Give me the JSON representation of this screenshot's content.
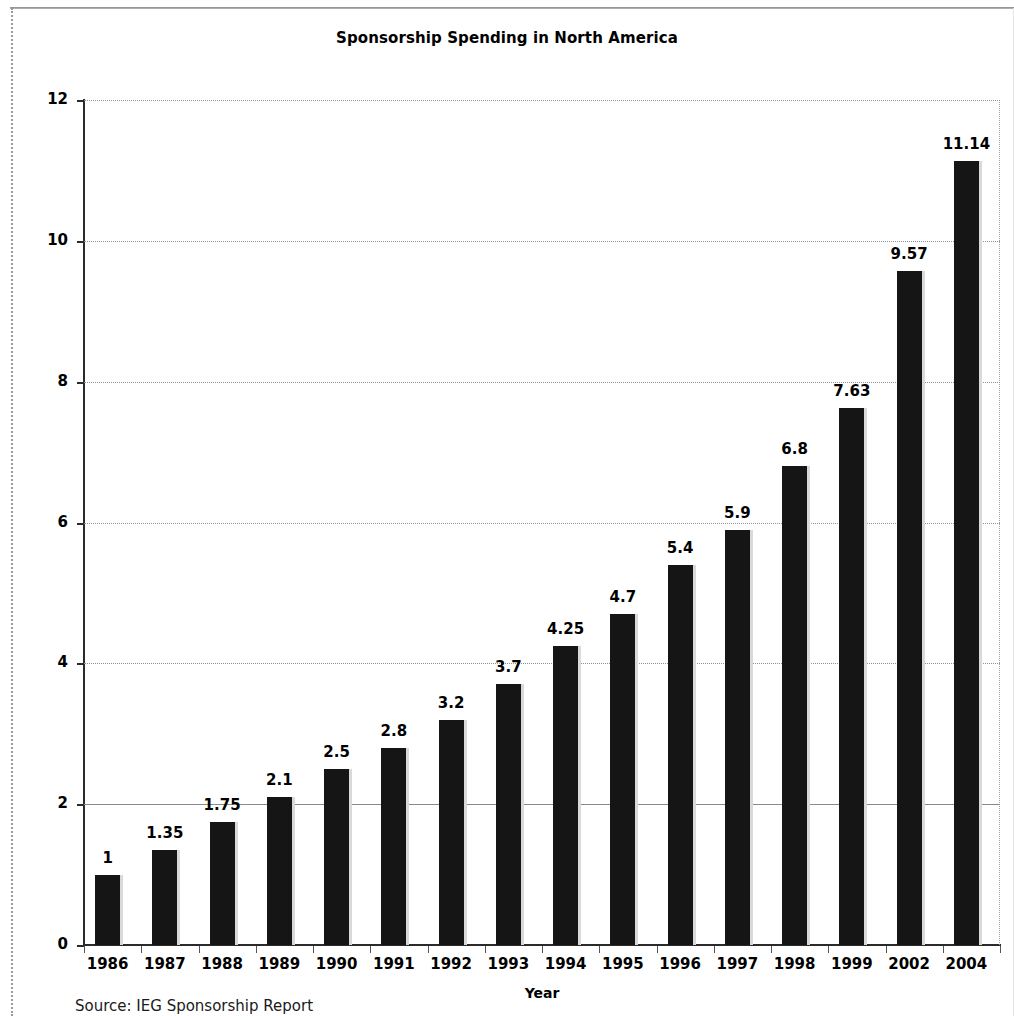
{
  "document": {
    "source_note": "Source: IEG Sponsorship Report"
  },
  "chart_data": {
    "type": "bar",
    "title": "Sponsorship Spending in North America",
    "xlabel": "Year",
    "ylabel": "Billions of Dollars",
    "ylim": [
      0,
      12
    ],
    "ytick_values": [
      0,
      2,
      4,
      6,
      8,
      10,
      12
    ],
    "ytick_labels": [
      "0",
      "2",
      "4",
      "6",
      "8",
      "10",
      "12"
    ],
    "grid": "horizontal-dotted",
    "legend": "none",
    "bar_color": "#151515",
    "bar_shadow_color": "#d9d9d9",
    "gridline_color": "#8f8f8f",
    "axis_color": "#2b2b2b",
    "categories": [
      "1986",
      "1987",
      "1988",
      "1989",
      "1990",
      "1991",
      "1992",
      "1993",
      "1994",
      "1995",
      "1996",
      "1997",
      "1998",
      "1999",
      "2002",
      "2004"
    ],
    "values": [
      1,
      1.35,
      1.75,
      2.1,
      2.5,
      2.8,
      3.2,
      3.7,
      4.25,
      4.7,
      5.4,
      5.9,
      6.8,
      7.63,
      9.57,
      11.14
    ],
    "value_labels": [
      "1",
      "1.35",
      "1.75",
      "2.1",
      "2.5",
      "2.8",
      "3.2",
      "3.7",
      "4.25",
      "4.7",
      "5.4",
      "5.9",
      "6.8",
      "7.63",
      "9.57",
      "11.14"
    ]
  }
}
